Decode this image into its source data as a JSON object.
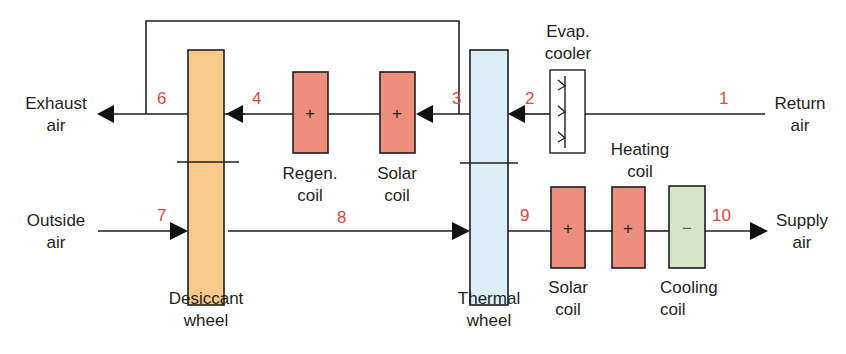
{
  "diagram": {
    "type": "desiccant cooling system schematic",
    "colors": {
      "line": "#1f1f1f",
      "state_number": "#e0483a",
      "desiccant_wheel": "#f7c98a",
      "thermal_wheel": "#dbeef7",
      "heating_coil": "#ec8f7c",
      "cooling_coil": "#d5e6c8"
    },
    "components": {
      "desiccant_wheel": {
        "label_line1": "Desiccant",
        "label_line2": "wheel"
      },
      "thermal_wheel": {
        "label_line1": "Thermal",
        "label_line2": "wheel"
      },
      "regen_coil": {
        "label_line1": "Regen.",
        "label_line2": "coil",
        "symbol": "+"
      },
      "solar_coil_upper": {
        "label_line1": "Solar",
        "label_line2": "coil",
        "symbol": "+"
      },
      "evap_cooler": {
        "label_line1": "Evap.",
        "label_line2": "cooler"
      },
      "solar_coil_lower": {
        "label_line1": "Solar",
        "label_line2": "coil",
        "symbol": "+"
      },
      "heating_coil": {
        "label_line1": "Heating",
        "label_line2": "coil",
        "symbol": "+"
      },
      "cooling_coil": {
        "label_line1": "Cooling",
        "label_line2": "coil",
        "symbol": "−"
      }
    },
    "streams": {
      "exhaust": {
        "line1": "Exhaust",
        "line2": "air"
      },
      "outside": {
        "line1": "Outside",
        "line2": "air"
      },
      "return": {
        "line1": "Return",
        "line2": "air"
      },
      "supply": {
        "line1": "Supply",
        "line2": "air"
      }
    },
    "state_points": [
      "1",
      "2",
      "3",
      "4",
      "6",
      "7",
      "8",
      "9",
      "10"
    ]
  }
}
